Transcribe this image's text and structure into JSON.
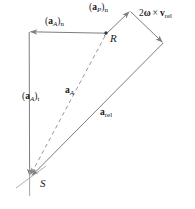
{
  "figure": {
    "kind": "vector-acceleration-diagram",
    "background_color": "#ffffff",
    "line_color": "#808080",
    "text_color": "#1a1a1a"
  },
  "points": [
    {
      "id": "S",
      "label": "S",
      "x": 30,
      "y": 176,
      "role": "tail-origin"
    },
    {
      "id": "R",
      "label": "R",
      "x": 106,
      "y": 34,
      "role": "intermediate-node"
    },
    {
      "id": "T",
      "label": "",
      "x": 29,
      "y": 32,
      "role": "top-left-corner"
    },
    {
      "id": "A",
      "label": "",
      "x": 130,
      "y": 11,
      "role": "apex"
    },
    {
      "id": "V",
      "label": "",
      "x": 163,
      "y": 43,
      "role": "right-vertex"
    }
  ],
  "vectors": [
    {
      "name": "aAn",
      "label_html": "(<b>a</b><sub>A</sub>)<sub class='rm'>n</sub>",
      "label_text": "(aA)n",
      "style": "solid",
      "from": [
        106,
        34
      ],
      "to": [
        29,
        32
      ],
      "arrow_at": "to"
    },
    {
      "name": "aAt",
      "label_html": "(<b>a</b><sub>A</sub>)<sub class='rm'>t</sub>",
      "label_text": "(aA)t",
      "style": "solid",
      "from": [
        29,
        32
      ],
      "to": [
        30,
        176
      ],
      "arrow_at": "to"
    },
    {
      "name": "aA",
      "label_html": "<b>a</b><sub>A</sub>",
      "label_text": "aA",
      "style": "dashed",
      "from": [
        106,
        34
      ],
      "to": [
        31,
        175
      ],
      "arrow_at": "to"
    },
    {
      "name": "aPn",
      "label_html": "(<b>a</b><sub>P</sub>)<sub class='rm'>n</sub>",
      "label_text": "(aP)n",
      "style": "solid",
      "from": [
        106,
        34
      ],
      "to": [
        130,
        11
      ],
      "arrow_at": "to"
    },
    {
      "name": "coriolis",
      "label_html": "2<b>&omega;</b> &times; <b>v</b><sub class='rm'>rel</sub>",
      "label_text": "2w x vrel",
      "style": "solid",
      "from": [
        130,
        11
      ],
      "to": [
        163,
        43
      ],
      "arrow_at": "to"
    },
    {
      "name": "arel",
      "label_html": "<b>a</b><sub class='rm'>rel</sub>",
      "label_text": "arel",
      "style": "solid",
      "from": [
        163,
        43
      ],
      "to": [
        33,
        176
      ],
      "arrow_at": "to"
    }
  ],
  "labels": {
    "aAn": "(a_A)_n",
    "aPn": "(a_P)_n",
    "coriolis": "2ω × v_rel",
    "aAt": "(a_A)_t",
    "aA": "a_A",
    "arel": "a_rel",
    "point_R": "R",
    "point_S": "S"
  }
}
